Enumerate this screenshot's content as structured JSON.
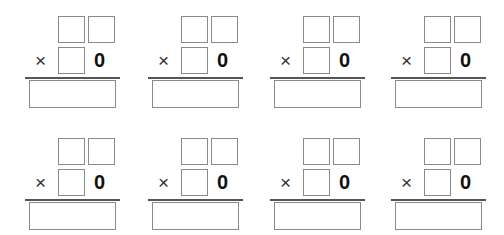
{
  "worksheet": {
    "problems": [
      {
        "operator": "×",
        "multiplier_digit": "0"
      },
      {
        "operator": "×",
        "multiplier_digit": "0"
      },
      {
        "operator": "×",
        "multiplier_digit": "0"
      },
      {
        "operator": "×",
        "multiplier_digit": "0"
      },
      {
        "operator": "×",
        "multiplier_digit": "0"
      },
      {
        "operator": "×",
        "multiplier_digit": "0"
      },
      {
        "operator": "×",
        "multiplier_digit": "0"
      },
      {
        "operator": "×",
        "multiplier_digit": "0"
      }
    ]
  }
}
